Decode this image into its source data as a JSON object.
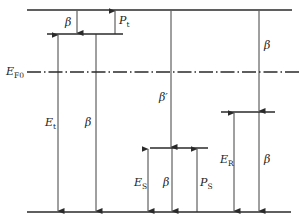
{
  "diagram": {
    "type": "energy-level-diagram",
    "colors": {
      "line": "#2a2a2a",
      "background": "#ffffff"
    },
    "levels": [
      {
        "id": "conduction-band",
        "label": ""
      },
      {
        "id": "trap-level",
        "label": ""
      },
      {
        "id": "fermi-level",
        "label_main": "E",
        "label_sub": "F0",
        "style": "dash-dot"
      },
      {
        "id": "recombination-level",
        "label": ""
      },
      {
        "id": "surface-level",
        "label": ""
      },
      {
        "id": "valence-band",
        "label": ""
      }
    ],
    "labels": {
      "beta_top": "β",
      "p_t_main": "P",
      "p_t_sub": "t",
      "e_t_main": "E",
      "e_t_sub": "t",
      "beta_left": "β",
      "beta_prime": "β′",
      "beta_right_top": "β",
      "e_r_main": "E",
      "e_r_sub": "R",
      "beta_right_bottom": "β",
      "e_s_main": "E",
      "e_s_sub": "S",
      "beta_mid": "β",
      "p_s_main": "P",
      "p_s_sub": "S"
    }
  }
}
